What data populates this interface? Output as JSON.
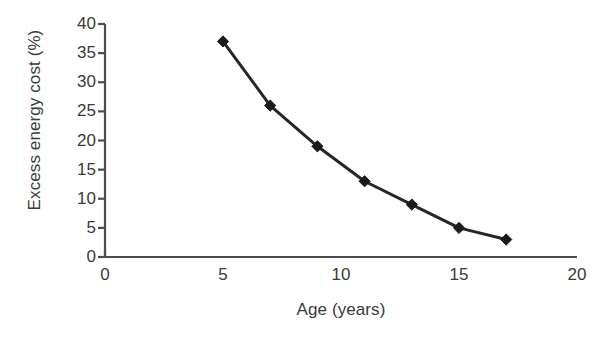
{
  "chart_data": {
    "type": "line",
    "title": "",
    "subtitle": "",
    "xlabel": "Age (years)",
    "ylabel": "Excess energy cost (%)",
    "xlim": [
      0,
      20
    ],
    "ylim": [
      0,
      40
    ],
    "xticks": [
      "0",
      "5",
      "10",
      "15",
      "20"
    ],
    "xtick_values": [
      0,
      5,
      10,
      15,
      20
    ],
    "yticks": [
      "0",
      "5",
      "10",
      "15",
      "20",
      "25",
      "30",
      "35",
      "40"
    ],
    "ytick_values": [
      0,
      5,
      10,
      15,
      20,
      25,
      30,
      35,
      40
    ],
    "grid": false,
    "legend": false,
    "legend_position": "none",
    "marker": "diamond",
    "line_color": "#262626",
    "marker_color": "#1a1a1a",
    "axis_color": "#4d4d4d",
    "background_color": "#ffffff",
    "x": [
      5,
      7,
      9,
      11,
      13,
      15,
      17
    ],
    "values": [
      37,
      26,
      19,
      13,
      9,
      5,
      3
    ],
    "series": [
      {
        "name": "Excess energy cost",
        "x": [
          5,
          7,
          9,
          11,
          13,
          15,
          17
        ],
        "values": [
          37,
          26,
          19,
          13,
          9,
          5,
          3
        ]
      }
    ],
    "annotations": []
  }
}
